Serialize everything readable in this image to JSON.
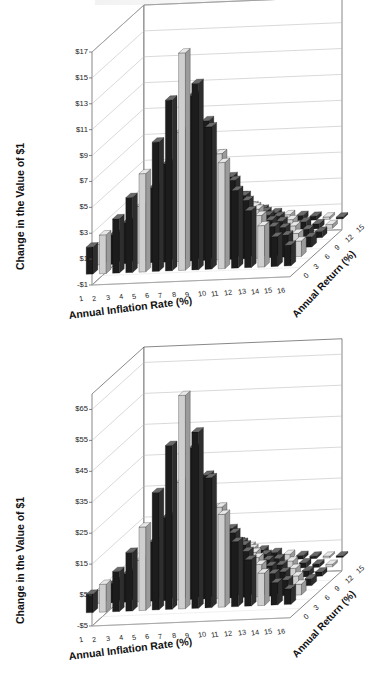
{
  "figure": {
    "background": "#ffffff",
    "top_scan_artifact": true
  },
  "panels": [
    {
      "id": "c",
      "title": "(c) 20 Years",
      "ylabel": "Change in the Value of $1",
      "xlabel": "Annual Inflation Rate (%)",
      "zlabel": "Annual Return (%)"
    },
    {
      "id": "d",
      "title": "(d) 30 Years",
      "ylabel": "Change in the Value of $1",
      "xlabel": "Annual Inflation Rate (%)",
      "zlabel": "Annual Return (%)"
    }
  ],
  "chart_data": [
    {
      "type": "bar",
      "id": "panel-c",
      "title": "(c) 20 Years",
      "xlabel": "Annual Inflation Rate (%)",
      "ylabel": "Change in the Value of $1",
      "zlabel": "Annual Return (%)",
      "projection": "3d",
      "grid": true,
      "legend": "none",
      "x_categories": [
        "1",
        "2",
        "3",
        "4",
        "5",
        "6",
        "7",
        "8",
        "9",
        "10",
        "11",
        "12",
        "13",
        "14",
        "15",
        "16"
      ],
      "z_categories": [
        "0",
        "3",
        "6",
        "9",
        "12",
        "15"
      ],
      "z_tick_labels": [
        "0",
        "3",
        "6",
        "9",
        "12",
        "15"
      ],
      "y_tick_labels": [
        "-$1",
        "$1",
        "$3",
        "$5",
        "$7",
        "$9",
        "$11",
        "$13",
        "$15",
        "$17"
      ],
      "ylim": [
        -1,
        17
      ],
      "y_tick_values": [
        -1,
        1,
        3,
        5,
        7,
        9,
        11,
        13,
        15,
        17
      ],
      "series": [
        {
          "name": "Annual Return 15%",
          "z": 15,
          "values": [
            2.1,
            3.0,
            4.2,
            5.8,
            7.6,
            10.0,
            13.2,
            16.8,
            14.4,
            11.0,
            8.2,
            6.0,
            4.4,
            3.2,
            2.3,
            1.6
          ]
        },
        {
          "name": "Annual Return 12%",
          "z": 12,
          "values": [
            1.6,
            2.3,
            3.2,
            4.4,
            5.8,
            7.6,
            10.0,
            12.8,
            10.8,
            8.2,
            6.1,
            4.5,
            3.3,
            2.4,
            1.7,
            1.2
          ]
        },
        {
          "name": "Annual Return 9%",
          "z": 9,
          "values": [
            1.1,
            1.6,
            2.2,
            3.0,
            4.0,
            5.3,
            7.0,
            8.9,
            7.5,
            5.7,
            4.2,
            3.1,
            2.2,
            1.6,
            1.1,
            0.8
          ]
        },
        {
          "name": "Annual Return 6%",
          "z": 6,
          "values": [
            0.7,
            1.0,
            1.4,
            1.9,
            2.5,
            3.3,
            4.3,
            5.5,
            4.6,
            3.5,
            2.6,
            1.9,
            1.4,
            1.0,
            0.7,
            0.5
          ]
        },
        {
          "name": "Annual Return 3%",
          "z": 3,
          "values": [
            0.4,
            0.6,
            0.8,
            1.1,
            1.4,
            1.9,
            2.4,
            3.1,
            2.6,
            2.0,
            1.5,
            1.1,
            0.8,
            0.6,
            0.4,
            0.3
          ]
        },
        {
          "name": "Annual Return 0%",
          "z": 0,
          "values": [
            0.2,
            0.3,
            0.4,
            0.5,
            0.7,
            0.9,
            1.2,
            1.5,
            1.3,
            1.0,
            0.7,
            0.5,
            0.4,
            0.3,
            0.2,
            0.15
          ]
        }
      ],
      "note": "Surface peaks near inflation 7-8% and highest annual return; values decay toward both extremes."
    },
    {
      "type": "bar",
      "id": "panel-d",
      "title": "(d) 30 Years",
      "xlabel": "Annual Inflation Rate (%)",
      "ylabel": "Change in the Value of $1",
      "zlabel": "Annual Return (%)",
      "projection": "3d",
      "grid": true,
      "legend": "none",
      "x_categories": [
        "1",
        "2",
        "3",
        "4",
        "5",
        "6",
        "7",
        "8",
        "9",
        "10",
        "11",
        "12",
        "13",
        "14",
        "15",
        "16"
      ],
      "z_categories": [
        "0",
        "3",
        "6",
        "9",
        "12",
        "15"
      ],
      "z_tick_labels": [
        "0",
        "3",
        "6",
        "9",
        "12",
        "15"
      ],
      "y_tick_labels": [
        "-$5",
        "$5",
        "$15",
        "$25",
        "$35",
        "$45",
        "$55",
        "$65"
      ],
      "ylim": [
        -5,
        70
      ],
      "y_tick_values": [
        -5,
        5,
        15,
        25,
        35,
        45,
        55,
        65
      ],
      "series": [
        {
          "name": "Annual Return 15%",
          "z": 15,
          "values": [
            6.0,
            9.0,
            13.0,
            19.0,
            27.0,
            38.0,
            53.0,
            69.0,
            57.0,
            42.0,
            30.0,
            21.0,
            15.0,
            10.5,
            7.2,
            5.0
          ]
        },
        {
          "name": "Annual Return 12%",
          "z": 12,
          "values": [
            4.2,
            6.3,
            9.2,
            13.4,
            19.2,
            27.0,
            38.0,
            49.0,
            40.0,
            29.5,
            21.0,
            14.8,
            10.4,
            7.3,
            5.0,
            3.5
          ]
        },
        {
          "name": "Annual Return 9%",
          "z": 9,
          "values": [
            2.8,
            4.2,
            6.1,
            8.9,
            12.7,
            17.8,
            25.0,
            32.0,
            26.5,
            19.5,
            14.0,
            9.8,
            6.9,
            4.8,
            3.3,
            2.3
          ]
        },
        {
          "name": "Annual Return 6%",
          "z": 6,
          "values": [
            1.7,
            2.6,
            3.8,
            5.5,
            7.8,
            11.0,
            15.4,
            19.8,
            16.3,
            12.0,
            8.6,
            6.0,
            4.2,
            2.9,
            2.0,
            1.4
          ]
        },
        {
          "name": "Annual Return 3%",
          "z": 3,
          "values": [
            1.0,
            1.5,
            2.2,
            3.1,
            4.5,
            6.3,
            8.8,
            11.3,
            9.3,
            6.9,
            4.9,
            3.4,
            2.4,
            1.7,
            1.1,
            0.8
          ]
        },
        {
          "name": "Annual Return 0%",
          "z": 0,
          "values": [
            0.5,
            0.8,
            1.1,
            1.6,
            2.3,
            3.2,
            4.5,
            5.8,
            4.8,
            3.5,
            2.5,
            1.7,
            1.2,
            0.8,
            0.6,
            0.4
          ]
        }
      ],
      "note": "Same shape as 20-year panel but larger magnitudes; peak around $69 at inflation 8%."
    }
  ],
  "colors": {
    "bar_dark": "#1c1c1c",
    "bar_mid": "#4a4a4a",
    "bar_light": "#cfcfcf",
    "bar_top": "#e8e8e8",
    "grid": "#b9b9b9",
    "axis": "#555555",
    "text": "#111111",
    "background": "#ffffff"
  }
}
